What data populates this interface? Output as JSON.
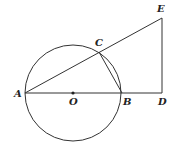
{
  "diagram": {
    "type": "geometry",
    "stroke_color": "#333333",
    "background": "#ffffff",
    "circle": {
      "center": "O",
      "cx": 73,
      "cy": 93,
      "r": 48
    },
    "points": {
      "A": {
        "label": "A",
        "x": 25,
        "y": 93,
        "lx": 14,
        "ly": 97
      },
      "O": {
        "label": "O",
        "x": 73,
        "y": 93,
        "lx": 69,
        "ly": 105
      },
      "B": {
        "label": "B",
        "x": 122,
        "y": 93,
        "lx": 123,
        "ly": 105
      },
      "C": {
        "label": "C",
        "x": 99,
        "y": 52,
        "lx": 95,
        "ly": 46
      },
      "D": {
        "label": "D",
        "x": 162,
        "y": 93,
        "lx": 158,
        "ly": 105
      },
      "E": {
        "label": "E",
        "x": 162,
        "y": 18,
        "lx": 157,
        "ly": 12
      }
    },
    "segments": [
      {
        "from": "A",
        "to": "D",
        "name": "segment-ad"
      },
      {
        "from": "A",
        "to": "E",
        "name": "segment-ae"
      },
      {
        "from": "E",
        "to": "D",
        "name": "segment-ed"
      },
      {
        "from": "C",
        "to": "B",
        "name": "segment-cb"
      }
    ]
  }
}
